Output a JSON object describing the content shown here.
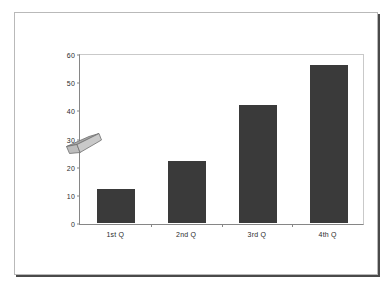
{
  "chart_data": {
    "type": "bar",
    "title": "",
    "subtitle": "",
    "xlabel": "",
    "ylabel": "",
    "categories": [
      "1st Q",
      "2nd Q",
      "3rd Q",
      "4th Q"
    ],
    "values": [
      12,
      22,
      42,
      56
    ],
    "series": [
      {
        "name": "",
        "values": [
          12,
          22,
          42,
          56
        ]
      }
    ],
    "ylim": [
      0,
      60
    ],
    "yticks": [
      0,
      10,
      20,
      30,
      40,
      50,
      60
    ],
    "ytick_labels": [
      "0",
      "10",
      "20",
      "30",
      "40",
      "50",
      "60"
    ],
    "grid": false,
    "legend": "none",
    "bar_color": "#3a3a3a",
    "plot_border_color": "#868686",
    "annotations": [
      {
        "name": "axis-arrow",
        "shape": "parallelogram-arrow",
        "color": "#9c9c9c",
        "near_value": 30,
        "note": ""
      }
    ]
  },
  "caption": {
    "text": ""
  }
}
